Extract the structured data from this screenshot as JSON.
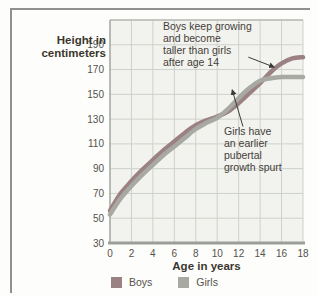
{
  "figure": {
    "kind": "textbook growth chart"
  },
  "chart_data": {
    "type": "line",
    "title": "",
    "xlabel": "Age in years",
    "ylabel": "Height in centimeters",
    "x": [
      0,
      1,
      2,
      3,
      4,
      5,
      6,
      7,
      8,
      9,
      10,
      11,
      12,
      13,
      14,
      15,
      16,
      17,
      18
    ],
    "series": [
      {
        "name": "Boys",
        "color": "#9c8183",
        "values": [
          56,
          70,
          80,
          89,
          97,
          105,
          112,
          119,
          125,
          129,
          132,
          136,
          143,
          151,
          159,
          168,
          175,
          179,
          180
        ]
      },
      {
        "name": "Girls",
        "color": "#a7a9a2",
        "values": [
          53,
          66,
          76,
          85,
          93,
          101,
          108,
          115,
          122,
          127,
          131,
          138,
          147,
          155,
          161,
          163,
          164,
          164,
          164
        ]
      }
    ],
    "xlim": [
      0,
      18
    ],
    "ylim": [
      30,
      210
    ],
    "x_ticks": [
      0,
      2,
      4,
      6,
      8,
      10,
      12,
      14,
      16,
      18
    ],
    "y_ticks": [
      30,
      50,
      70,
      90,
      110,
      130,
      150,
      170,
      190
    ],
    "grid": true,
    "legend_position": "bottom",
    "annotations": [
      {
        "text": "Boys keep growing\nand become\ntaller than girls\nafter age 14",
        "arrow": {
          "from": {
            "age": 12.9,
            "cm": 180
          },
          "to": {
            "age": 15.3,
            "cm": 172
          }
        }
      },
      {
        "text": "Girls have\nan earlier\npubertal\ngrowth spurt",
        "arrow": {
          "from": {
            "age": 12.4,
            "cm": 124
          },
          "to": {
            "age": 11.4,
            "cm": 153.5
          }
        }
      }
    ],
    "colors": {
      "grid": "#cdd1cb",
      "plot_background": "#f2f3ee",
      "axis_bottom": "#9aa099",
      "axis_left": "#a9ada6",
      "plot_top_border": "#b9bdb6",
      "tick_text": "#55524b",
      "arrow": "#3a3a38"
    }
  }
}
